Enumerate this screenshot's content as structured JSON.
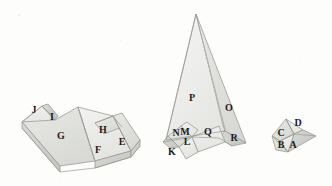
{
  "figure": {
    "background_color": "#fdfdfb",
    "ink_color": "#1b1b1b",
    "fill_light": "#ededeb",
    "fill_mid": "#e2e2df",
    "fill_dark": "#d2d2cf",
    "stroke_color": "#9a9a96"
  },
  "models": [
    {
      "name": "left-model",
      "description": "low elongated ridged tent-like polyhedron",
      "labels": [
        "J",
        "I",
        "G",
        "H",
        "F",
        "E"
      ]
    },
    {
      "name": "middle-model",
      "description": "tall narrow spire polyhedron with small folded flaps at base",
      "labels": [
        "P",
        "O",
        "N",
        "M",
        "L",
        "K",
        "Q",
        "R"
      ]
    },
    {
      "name": "right-model",
      "description": "small compact faceted polyhedron",
      "labels": [
        "D",
        "C",
        "B",
        "A"
      ]
    }
  ],
  "labels": [
    {
      "id": "label-J",
      "text": "J",
      "x": 34,
      "y": 110
    },
    {
      "id": "label-I",
      "text": "I",
      "x": 52,
      "y": 117
    },
    {
      "id": "label-G",
      "text": "G",
      "x": 61,
      "y": 136
    },
    {
      "id": "label-H",
      "text": "H",
      "x": 103,
      "y": 130
    },
    {
      "id": "label-F",
      "text": "F",
      "x": 98,
      "y": 150
    },
    {
      "id": "label-E",
      "text": "E",
      "x": 122,
      "y": 142
    },
    {
      "id": "label-P",
      "text": "P",
      "x": 192,
      "y": 98
    },
    {
      "id": "label-O",
      "text": "O",
      "x": 229,
      "y": 108
    },
    {
      "id": "label-N",
      "text": "N",
      "x": 176,
      "y": 133
    },
    {
      "id": "label-M",
      "text": "M",
      "x": 185,
      "y": 132
    },
    {
      "id": "label-L",
      "text": "L",
      "x": 187,
      "y": 142
    },
    {
      "id": "label-K",
      "text": "K",
      "x": 172,
      "y": 152
    },
    {
      "id": "label-Q",
      "text": "Q",
      "x": 208,
      "y": 132
    },
    {
      "id": "label-R",
      "text": "R",
      "x": 234,
      "y": 138
    },
    {
      "id": "label-D",
      "text": "D",
      "x": 298,
      "y": 123
    },
    {
      "id": "label-C",
      "text": "C",
      "x": 281,
      "y": 133
    },
    {
      "id": "label-B",
      "text": "B",
      "x": 281,
      "y": 145
    },
    {
      "id": "label-A",
      "text": "A",
      "x": 293,
      "y": 145
    }
  ]
}
